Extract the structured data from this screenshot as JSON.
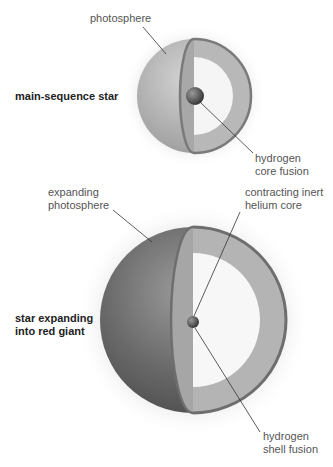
{
  "stars": [
    {
      "title": "main-sequence star",
      "labels": {
        "photosphere": "photosphere",
        "core": "hydrogen\ncore fusion"
      }
    },
    {
      "title": "star expanding\ninto red giant",
      "labels": {
        "photosphere": "expanding\nphotosphere",
        "core": "contracting inert\nhelium core",
        "shell": "hydrogen\nshell fusion"
      }
    }
  ],
  "colors": {
    "halo": "#d8d8d8",
    "sphere_light": "#c4c4c4",
    "sphere_dark": "#6e6e6e",
    "shell": "#b4b4b4",
    "shell_edge": "#7a7a7a",
    "inner": "#f6f6f6",
    "leader": "#333333"
  }
}
